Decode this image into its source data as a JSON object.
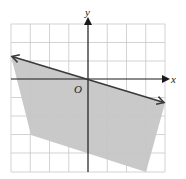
{
  "graph": {
    "x_axis_label": "x",
    "y_axis_label": "y",
    "origin_label": "O",
    "x_range": [
      -4,
      4
    ],
    "y_range": [
      -5,
      3
    ],
    "grid_step": 1,
    "colors": {
      "grid": "#c8c8c8",
      "axis": "#1a1a1a",
      "boundary_line": "#3a3a3a",
      "shaded_region": "#c9c9c9"
    },
    "boundary_line": {
      "points": [
        [
          -4,
          1.2
        ],
        [
          0,
          0
        ],
        [
          4,
          -1.2
        ]
      ],
      "arrows": "both ends",
      "style": "solid"
    },
    "shaded_region_vertices": [
      [
        -4,
        1.2
      ],
      [
        4,
        -1.2
      ],
      [
        3,
        -5
      ],
      [
        -3,
        -3
      ]
    ]
  }
}
